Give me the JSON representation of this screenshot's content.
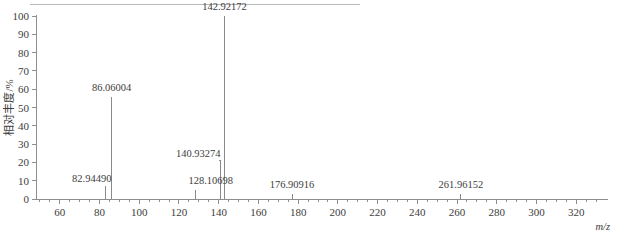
{
  "figure": {
    "has_top_rule": true,
    "background_color": "#ffffff",
    "line_color": "#8a8a8a",
    "text_color": "#3d3d3d"
  },
  "chart_data": {
    "type": "bar",
    "title": "",
    "xlabel": "m/z",
    "ylabel": "相对丰度/%",
    "xlim": [
      48,
      332
    ],
    "ylim": [
      0,
      100
    ],
    "grid": false,
    "legend": null,
    "x_ticks": [
      60,
      80,
      100,
      120,
      140,
      160,
      180,
      200,
      220,
      240,
      260,
      280,
      300,
      320
    ],
    "x_tick_labels": [
      "60",
      "80",
      "100",
      "120",
      "140",
      "160",
      "180",
      "200",
      "220",
      "240",
      "260",
      "280",
      "300",
      "320"
    ],
    "x_minor_tick_step": 5,
    "y_ticks": [
      0,
      10,
      20,
      30,
      40,
      50,
      60,
      70,
      80,
      90,
      100
    ],
    "y_tick_labels": [
      "0",
      "10",
      "20",
      "30",
      "40",
      "50",
      "60",
      "70",
      "80",
      "90",
      "100"
    ],
    "x": [
      82.9449,
      86.06004,
      128.10698,
      140.93274,
      142.92172,
      176.90916,
      261.96152
    ],
    "values": [
      7,
      56,
      5,
      13,
      100,
      3,
      3
    ],
    "peaks": [
      {
        "mz": "82.94490",
        "mz_value": 82.9449,
        "intensity": 7,
        "label": "82.94490",
        "label_anchor": "end",
        "label_dx": 6,
        "label_dy": -4,
        "leader": false
      },
      {
        "mz": "86.06004",
        "mz_value": 86.06004,
        "intensity": 56,
        "label": "86.06004",
        "label_anchor": "middle",
        "label_dx": 0,
        "label_dy": -6,
        "leader": false
      },
      {
        "mz": "128.10698",
        "mz_value": 128.10698,
        "intensity": 5,
        "label": "128.10698",
        "label_anchor": "end",
        "label_dx": 38,
        "label_dy": -6,
        "leader": false
      },
      {
        "mz": "140.93274",
        "mz_value": 140.93274,
        "intensity": 13,
        "label": "140.93274",
        "label_anchor": "end",
        "label_dx": 0,
        "label_dy": -18,
        "leader": true
      },
      {
        "mz": "142.92172",
        "mz_value": 142.92172,
        "intensity": 100,
        "label": "142.92172",
        "label_anchor": "middle",
        "label_dx": 0,
        "label_dy": -6,
        "leader": false
      },
      {
        "mz": "176.90916",
        "mz_value": 176.90916,
        "intensity": 3,
        "label": "176.90916",
        "label_anchor": "middle",
        "label_dx": 0,
        "label_dy": -6,
        "leader": false
      },
      {
        "mz": "261.96152",
        "mz_value": 261.96152,
        "intensity": 3,
        "label": "261.96152",
        "label_anchor": "middle",
        "label_dx": 0,
        "label_dy": -6,
        "leader": false
      }
    ]
  }
}
